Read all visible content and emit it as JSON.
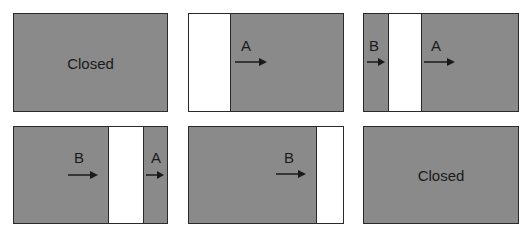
{
  "diagram": {
    "colors": {
      "closed_fill": "#8a8a8a",
      "open_fill": "#ffffff",
      "border": "#2a2a2a",
      "text": "#1a1a1a"
    },
    "panels": [
      {
        "id": 1,
        "state_label": "Closed"
      },
      {
        "id": 2,
        "labels": [
          "A"
        ]
      },
      {
        "id": 3,
        "labels": [
          "B",
          "A"
        ]
      },
      {
        "id": 4,
        "labels": [
          "B",
          "A"
        ]
      },
      {
        "id": 5,
        "labels": [
          "B"
        ]
      },
      {
        "id": 6,
        "state_label": "Closed"
      }
    ],
    "arrow_direction": "right"
  }
}
